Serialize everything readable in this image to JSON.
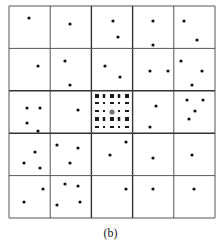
{
  "figure": {
    "caption": "(b)",
    "grid": {
      "left": 9,
      "top": 6,
      "right": 215,
      "bottom": 218,
      "rows": 5,
      "cols": 5,
      "line_color": "#555555",
      "thick_line_color": "#333333"
    },
    "dot_color": "#111111",
    "dot_radius": 1.6,
    "cells": [
      {
        "row": 0,
        "col": 0,
        "dots": [
          [
            29,
            18
          ]
        ]
      },
      {
        "row": 0,
        "col": 1,
        "dots": [
          [
            70,
            24
          ]
        ]
      },
      {
        "row": 0,
        "col": 2,
        "dots": [
          [
            113,
            21
          ],
          [
            118,
            37
          ]
        ]
      },
      {
        "row": 0,
        "col": 3,
        "dots": [
          [
            153,
            21
          ],
          [
            153,
            45
          ]
        ]
      },
      {
        "row": 0,
        "col": 4,
        "dots": [
          [
            184,
            21
          ],
          [
            197,
            40
          ]
        ]
      },
      {
        "row": 1,
        "col": 0,
        "dots": [
          [
            38,
            66
          ]
        ]
      },
      {
        "row": 1,
        "col": 1,
        "dots": [
          [
            65,
            61
          ],
          [
            70,
            85
          ]
        ]
      },
      {
        "row": 1,
        "col": 2,
        "dots": [
          [
            105,
            66
          ],
          [
            120,
            77
          ]
        ]
      },
      {
        "row": 1,
        "col": 3,
        "dots": [
          [
            150,
            71
          ],
          [
            168,
            71
          ]
        ]
      },
      {
        "row": 1,
        "col": 4,
        "dots": [
          [
            181,
            61
          ],
          [
            202,
            71
          ],
          [
            192,
            85
          ]
        ]
      },
      {
        "row": 2,
        "col": 0,
        "dots": [
          [
            27,
            108
          ],
          [
            40,
            108
          ],
          [
            27,
            123
          ],
          [
            38,
            131
          ]
        ]
      },
      {
        "row": 2,
        "col": 1,
        "dots": [
          [
            78,
            110
          ]
        ]
      },
      {
        "row": 2,
        "col": 3,
        "dots": [
          [
            156,
            106
          ],
          [
            150,
            127
          ]
        ]
      },
      {
        "row": 2,
        "col": 4,
        "dots": [
          [
            187,
            100
          ],
          [
            203,
            100
          ],
          [
            195,
            111
          ],
          [
            189,
            119
          ]
        ]
      },
      {
        "row": 3,
        "col": 0,
        "dots": [
          [
            35,
            152
          ],
          [
            24,
            163
          ],
          [
            40,
            168
          ]
        ]
      },
      {
        "row": 3,
        "col": 1,
        "dots": [
          [
            57,
            145
          ],
          [
            78,
            148
          ],
          [
            70,
            163
          ]
        ]
      },
      {
        "row": 3,
        "col": 2,
        "dots": [
          [
            126,
            142
          ],
          [
            110,
            155
          ]
        ]
      },
      {
        "row": 3,
        "col": 3,
        "dots": [
          [
            153,
            158
          ]
        ]
      },
      {
        "row": 3,
        "col": 4,
        "dots": [
          [
            192,
            155
          ]
        ]
      },
      {
        "row": 4,
        "col": 0,
        "dots": [
          [
            43,
            189
          ],
          [
            24,
            202
          ]
        ]
      },
      {
        "row": 4,
        "col": 1,
        "dots": [
          [
            65,
            184
          ],
          [
            78,
            186
          ],
          [
            57,
            205
          ],
          [
            80,
            202
          ]
        ]
      },
      {
        "row": 4,
        "col": 2,
        "dots": [
          [
            126,
            189
          ]
        ]
      },
      {
        "row": 4,
        "col": 3,
        "dots": [
          [
            153,
            189
          ]
        ]
      },
      {
        "row": 4,
        "col": 4,
        "dots": [
          [
            194,
            189
          ]
        ]
      }
    ],
    "center_cell": {
      "row": 2,
      "col": 2,
      "lattice_x": [
        97,
        104,
        112,
        119,
        127
      ],
      "lattice_y": [
        96,
        103,
        111,
        119,
        127
      ],
      "big_mark_rows": [
        0,
        3
      ],
      "center_dot": {
        "x": 112,
        "y": 112,
        "r": 2.6,
        "color": "#777777"
      }
    }
  }
}
